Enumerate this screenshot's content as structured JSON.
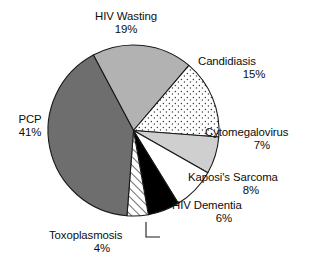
{
  "chart_data": {
    "type": "pie",
    "title": "",
    "subtitle": "",
    "xlabel": "",
    "ylabel": "",
    "legend_position": "none",
    "grid": false,
    "labels_outside": true,
    "units": "percent",
    "total": 100,
    "categories": [
      "HIV Wasting",
      "Candidiasis",
      "Cytomegalovirus",
      "Kaposi's Sarcoma",
      "HIV Dementia",
      "Toxoplasmosis",
      "PCP"
    ],
    "values": [
      19,
      15,
      7,
      8,
      6,
      4,
      41
    ],
    "slices": [
      {
        "name": "HIV Wasting",
        "value": 19,
        "value_label": "19%",
        "fill": "#b2b2b2",
        "pattern": "solid",
        "stroke": "#1a1a1a"
      },
      {
        "name": "Candidiasis",
        "value": 15,
        "value_label": "15%",
        "fill": "#ffffff",
        "pattern": "dots",
        "stroke": "#1a1a1a"
      },
      {
        "name": "Cytomegalovirus",
        "value": 7,
        "value_label": "7%",
        "fill": "#cfcfcf",
        "pattern": "solid",
        "stroke": "#1a1a1a"
      },
      {
        "name": "Kaposi's Sarcoma",
        "value": 8,
        "value_label": "8%",
        "fill": "#ffffff",
        "pattern": "solid",
        "stroke": "#1a1a1a"
      },
      {
        "name": "HIV Dementia",
        "value": 6,
        "value_label": "6%",
        "fill": "#000000",
        "pattern": "solid",
        "stroke": "#1a1a1a"
      },
      {
        "name": "Toxoplasmosis",
        "value": 4,
        "value_label": "4%",
        "fill": "#ffffff",
        "pattern": "diagonal-hatch",
        "stroke": "#1a1a1a"
      },
      {
        "name": "PCP",
        "value": 41,
        "value_label": "41%",
        "fill": "#6e6e6e",
        "pattern": "solid",
        "stroke": "#1a1a1a"
      }
    ]
  },
  "labels": {
    "hiv_wasting": {
      "name": "HIV Wasting",
      "value": "19%"
    },
    "candidiasis": {
      "name": "Candidiasis",
      "value": "15%"
    },
    "cytomegalovirus": {
      "name": "Cytomegalovirus",
      "value": "7%"
    },
    "kaposi": {
      "name": "Kaposi's Sarcoma",
      "value": "8%"
    },
    "hiv_dementia": {
      "name": "HIV Dementia",
      "value": "6%"
    },
    "toxoplasmosis": {
      "name": "Toxoplasmosis",
      "value": "4%"
    },
    "pcp": {
      "name": "PCP",
      "value": "41%"
    }
  },
  "colors": {
    "outline": "#1a1a1a",
    "text": "#0d0d0d",
    "background": "#ffffff"
  }
}
